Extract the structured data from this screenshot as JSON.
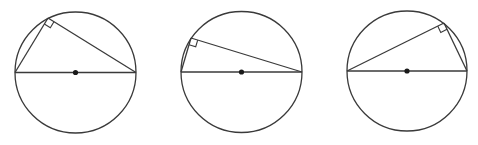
{
  "colors": {
    "stroke": "#3a3a3a",
    "center_dot": "#1a1a1a",
    "background": "#ffffff"
  },
  "figures": [
    {
      "id": "figure-1",
      "circle": {
        "cx": 75.5,
        "cy": 72.5,
        "r": 60.5
      },
      "diameter": {
        "x1": 15,
        "y1": 72.5,
        "x2": 136,
        "y2": 72.5
      },
      "vertex": {
        "x": 48,
        "y": 18
      },
      "right_angle_marker": true
    },
    {
      "id": "figure-2",
      "circle": {
        "cx": 241.5,
        "cy": 72,
        "r": 60.5
      },
      "diameter": {
        "x1": 181,
        "y1": 72,
        "x2": 302,
        "y2": 72
      },
      "vertex": {
        "x": 191,
        "y": 38
      },
      "right_angle_marker": true
    },
    {
      "id": "figure-3",
      "circle": {
        "cx": 407,
        "cy": 71,
        "r": 60
      },
      "diameter": {
        "x1": 347,
        "y1": 71,
        "x2": 467,
        "y2": 71
      },
      "vertex": {
        "x": 444,
        "y": 23
      },
      "right_angle_marker": true
    }
  ]
}
